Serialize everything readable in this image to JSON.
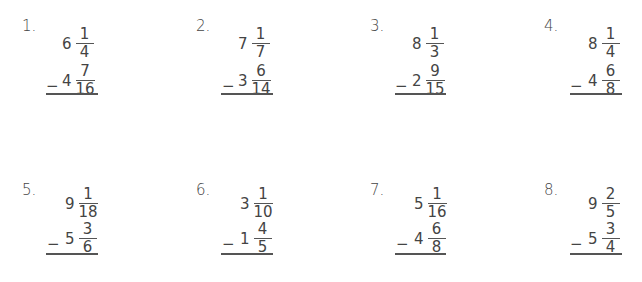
{
  "worksheet": {
    "operation_symbol": "−",
    "problems": [
      {
        "label": "1.",
        "top": {
          "whole": "6",
          "num": "1",
          "den": "4"
        },
        "bottom": {
          "whole": "4",
          "num": "7",
          "den": "16"
        }
      },
      {
        "label": "2.",
        "top": {
          "whole": "7",
          "num": "1",
          "den": "7"
        },
        "bottom": {
          "whole": "3",
          "num": "6",
          "den": "14"
        }
      },
      {
        "label": "3.",
        "top": {
          "whole": "8",
          "num": "1",
          "den": "3"
        },
        "bottom": {
          "whole": "2",
          "num": "9",
          "den": "15"
        }
      },
      {
        "label": "4.",
        "top": {
          "whole": "8",
          "num": "1",
          "den": "4"
        },
        "bottom": {
          "whole": "4",
          "num": "6",
          "den": "8"
        }
      },
      {
        "label": "5.",
        "top": {
          "whole": "9",
          "num": "1",
          "den": "18"
        },
        "bottom": {
          "whole": "5",
          "num": "3",
          "den": "6"
        }
      },
      {
        "label": "6.",
        "top": {
          "whole": "3",
          "num": "1",
          "den": "10"
        },
        "bottom": {
          "whole": "1",
          "num": "4",
          "den": "5"
        }
      },
      {
        "label": "7.",
        "top": {
          "whole": "5",
          "num": "1",
          "den": "16"
        },
        "bottom": {
          "whole": "4",
          "num": "6",
          "den": "8"
        }
      },
      {
        "label": "8.",
        "top": {
          "whole": "9",
          "num": "2",
          "den": "5"
        },
        "bottom": {
          "whole": "5",
          "num": "3",
          "den": "4"
        }
      }
    ]
  }
}
